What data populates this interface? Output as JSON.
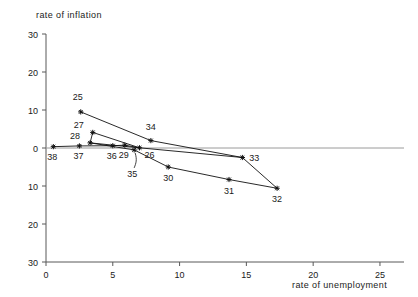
{
  "chart_data": {
    "type": "line",
    "title": "",
    "xlabel": "rate of unemployment",
    "ylabel": "rate of inflation",
    "xlim": [
      0,
      26.8
    ],
    "ylim": [
      -30,
      30
    ],
    "xticks": [
      "0",
      "5",
      "10",
      "15",
      "20",
      "25"
    ],
    "xtick_values": [
      0,
      5,
      10,
      15,
      20,
      25
    ],
    "yticks": [
      "30",
      "20",
      "10",
      "0",
      "10",
      "20",
      "30"
    ],
    "ytick_values": [
      30,
      20,
      10,
      0,
      -10,
      -20,
      -30
    ],
    "grid": false,
    "legend": "none",
    "zero_line": true,
    "series": [
      {
        "name": "Phillips curve path",
        "points": [
          {
            "label": "38",
            "x": 0.55,
            "y": 0.35,
            "label_dx": -1,
            "label_dy": -13
          },
          {
            "label": "37",
            "x": 2.5,
            "y": 0.55,
            "label_dx": -1,
            "label_dy": -13
          },
          {
            "label": "25",
            "x": 2.6,
            "y": 9.5,
            "label_dx": -3,
            "label_dy": 12
          },
          {
            "label": "27",
            "x": 3.5,
            "y": 4.1,
            "label_dx": -14,
            "label_dy": 4
          },
          {
            "label": "28",
            "x": 3.3,
            "y": 1.35,
            "label_dx": -15,
            "label_dy": 4
          },
          {
            "label": "36",
            "x": 5.0,
            "y": 0.6,
            "label_dx": -1,
            "label_dy": -13
          },
          {
            "label": "29",
            "x": 5.9,
            "y": 0.75,
            "label_dx": -1,
            "label_dy": -13
          },
          {
            "label": "35",
            "x": 6.6,
            "y": -0.5,
            "label_dx": -2,
            "label_dy": -27
          },
          {
            "label": "26",
            "x": 7.0,
            "y": 0.05,
            "label_dx": 10,
            "label_dy": -10
          },
          {
            "label": "34",
            "x": 7.85,
            "y": 1.95,
            "label_dx": 0,
            "label_dy": 11
          },
          {
            "label": "30",
            "x": 9.15,
            "y": -5.0,
            "label_dx": 0,
            "label_dy": -14
          },
          {
            "label": "31",
            "x": 13.7,
            "y": -8.3,
            "label_dx": 0,
            "label_dy": -14
          },
          {
            "label": "33",
            "x": 14.7,
            "y": -2.5,
            "label_dx": 12,
            "label_dy": -3
          },
          {
            "label": "32",
            "x": 17.3,
            "y": -10.6,
            "label_dx": 0,
            "label_dy": -14
          }
        ],
        "path_order": [
          "38",
          "37",
          "36",
          "29",
          "26",
          "33",
          "32",
          "31",
          "30",
          "35",
          "28",
          "27",
          "25",
          "34",
          "26"
        ],
        "segments": [
          [
            "38",
            "37"
          ],
          [
            "37",
            "36"
          ],
          [
            "36",
            "29"
          ],
          [
            "29",
            "26"
          ],
          [
            "25",
            "34"
          ],
          [
            "27",
            "26"
          ],
          [
            "28",
            "26"
          ],
          [
            "28",
            "27"
          ],
          [
            "26",
            "33"
          ],
          [
            "33",
            "32"
          ],
          [
            "32",
            "31"
          ],
          [
            "31",
            "30"
          ],
          [
            "30",
            "35"
          ],
          [
            "35",
            "28"
          ],
          [
            "34",
            "33"
          ]
        ]
      }
    ]
  },
  "axes": {
    "x_label": "rate of unemployment",
    "y_label": "rate of inflation"
  }
}
